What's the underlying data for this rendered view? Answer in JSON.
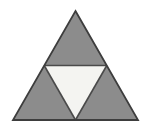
{
  "figure": {
    "title": "Subdivided equilateral triangle",
    "canvas": {
      "width": 151,
      "height": 132
    },
    "colors": {
      "background": "#ffffff",
      "shaded_fill": "#8c8c8c",
      "unshaded_fill": "#f4f4f1",
      "outline": "#3d3d3d",
      "inner_outline": "#4a4a4a"
    },
    "stroke_width": 1.6,
    "vertices": {
      "apex": {
        "label": "apex",
        "x": 75.5,
        "y": 11
      },
      "bottom_left": {
        "label": "bottom-left",
        "x": 13,
        "y": 120
      },
      "bottom_right": {
        "label": "bottom-right",
        "x": 138,
        "y": 120
      },
      "mid_left": {
        "label": "left midpoint",
        "x": 44.2,
        "y": 65.5
      },
      "mid_right": {
        "label": "right midpoint",
        "x": 106.8,
        "y": 65.5
      },
      "mid_bottom": {
        "label": "bottom midpoint",
        "x": 75.5,
        "y": 120
      }
    },
    "faces": [
      {
        "name": "top-triangle",
        "shading": "shaded",
        "fill": "#8c8c8c",
        "points": "75.5,11 106.8,65.5 44.2,65.5"
      },
      {
        "name": "bottom-left-triangle",
        "shading": "shaded",
        "fill": "#8c8c8c",
        "points": "44.2,65.5 75.5,120 13,120"
      },
      {
        "name": "bottom-right-triangle",
        "shading": "shaded",
        "fill": "#8c8c8c",
        "points": "106.8,65.5 138,120 75.5,120"
      },
      {
        "name": "center-inverted-triangle",
        "shading": "unshaded",
        "fill": "#f4f4f1",
        "points": "44.2,65.5 106.8,65.5 75.5,120"
      }
    ],
    "edges": [
      {
        "name": "outer-left-edge",
        "x1": 75.5,
        "y1": 11,
        "x2": 13,
        "y2": 120
      },
      {
        "name": "outer-right-edge",
        "x1": 75.5,
        "y1": 11,
        "x2": 138,
        "y2": 120
      },
      {
        "name": "outer-base-edge",
        "x1": 13,
        "y1": 120,
        "x2": 138,
        "y2": 120
      },
      {
        "name": "midsegment-horizontal",
        "x1": 44.2,
        "y1": 65.5,
        "x2": 106.8,
        "y2": 65.5
      },
      {
        "name": "midsegment-left",
        "x1": 44.2,
        "y1": 65.5,
        "x2": 75.5,
        "y2": 120
      },
      {
        "name": "midsegment-right",
        "x1": 106.8,
        "y1": 65.5,
        "x2": 75.5,
        "y2": 120
      }
    ],
    "counts": {
      "shaded_triangles": "3",
      "unshaded_triangles": "1",
      "total_small_triangles": "4"
    }
  }
}
